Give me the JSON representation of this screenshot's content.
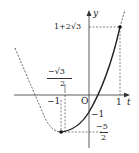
{
  "graph": {
    "function": "y = 2t^2 + 2√3 t - 1",
    "axis_x_label": "t",
    "axis_y_label": "y",
    "origin_label": "O",
    "labels": {
      "top_value": "1+2√3",
      "vertex_x_num": "−√3",
      "vertex_x_den": "2",
      "neg_one_x": "−1",
      "one_x": "1",
      "neg_one_y": "−1",
      "min_num": "−5",
      "min_den": "2"
    },
    "points": [
      {
        "t": 1,
        "y": "1+2√3"
      },
      {
        "t": "−√3/2",
        "y": "−5/2"
      }
    ]
  }
}
